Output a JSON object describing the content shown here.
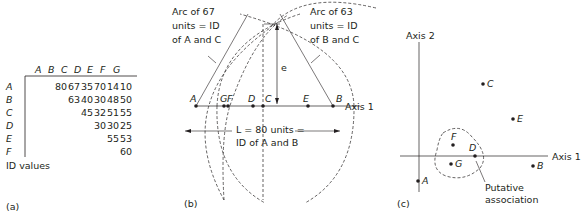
{
  "panel_a": {
    "label": "(a)",
    "caption": "ID values",
    "columns": [
      "A",
      "B",
      "C",
      "D",
      "E",
      "F",
      "G"
    ],
    "rows": [
      {
        "label": "A",
        "values": [
          "",
          "80",
          "67",
          "35",
          "70",
          "14",
          "10"
        ]
      },
      {
        "label": "B",
        "values": [
          "",
          "",
          "63",
          "40",
          "30",
          "48",
          "50"
        ]
      },
      {
        "label": "C",
        "values": [
          "",
          "",
          "",
          "45",
          "32",
          "51",
          "55"
        ]
      },
      {
        "label": "D",
        "values": [
          "",
          "",
          "",
          "",
          "30",
          "30",
          "25"
        ]
      },
      {
        "label": "E",
        "values": [
          "",
          "",
          "",
          "",
          "",
          "55",
          "53"
        ]
      },
      {
        "label": "F",
        "values": [
          "",
          "",
          "",
          "",
          "",
          "",
          "60"
        ]
      }
    ]
  },
  "panel_b": {
    "label": "(b)",
    "arc_left_text": [
      "Arc of 67",
      "units = ID",
      "of A and C"
    ],
    "arc_right_text": [
      "Arc of 63",
      "units = ID",
      "of B and C"
    ],
    "e_label": "e",
    "axis_label": "Axis 1",
    "points": [
      "A",
      "G",
      "F",
      "D",
      "C",
      "E",
      "B"
    ],
    "length_text": [
      "L = 80 units =",
      "ID of A and B"
    ]
  },
  "panel_c": {
    "label": "(c)",
    "axis1_label": "Axis 1",
    "axis2_label": "Axis 2",
    "points": [
      {
        "name": "C",
        "x": 483,
        "y": 84
      },
      {
        "name": "E",
        "x": 513,
        "y": 119
      },
      {
        "name": "F",
        "x": 453,
        "y": 145
      },
      {
        "name": "D",
        "x": 475,
        "y": 156
      },
      {
        "name": "G",
        "x": 451,
        "y": 164
      },
      {
        "name": "B",
        "x": 533,
        "y": 166
      },
      {
        "name": "A",
        "x": 418,
        "y": 181
      }
    ],
    "annotation": [
      "Putative",
      "association"
    ]
  }
}
